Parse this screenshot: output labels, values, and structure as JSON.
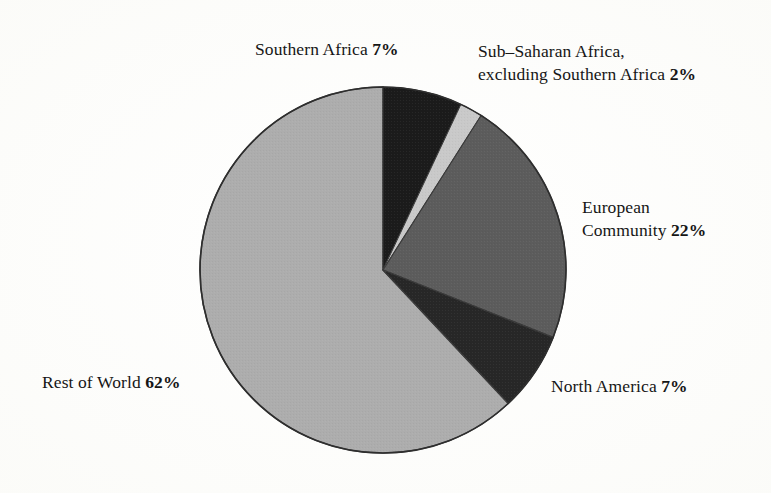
{
  "figure": {
    "background_color": "#fdfdfb",
    "text_color": "#161616"
  },
  "chart_data": {
    "type": "pie",
    "title": "",
    "subtitle": "",
    "xlabel": "",
    "ylabel": "",
    "legend_position": "none",
    "grid": false,
    "value_unit": "percent",
    "total": 100,
    "start_angle_deg": 0,
    "direction": "clockwise",
    "categories": [
      "Southern Africa",
      "Sub–Saharan Africa, excluding Southern Africa",
      "European Community",
      "North America",
      "Rest of World"
    ],
    "values": [
      7,
      2,
      22,
      7,
      62
    ],
    "colors": [
      "#1b1b1b",
      "#c9c9c9",
      "#5c5c5c",
      "#272727",
      "#adadad"
    ],
    "slices": [
      {
        "name": "Southern Africa",
        "value": 7,
        "value_label": "7%",
        "color": "#1b1b1b",
        "start_deg": 0,
        "end_deg": 25.2
      },
      {
        "name": "Sub–Saharan Africa, excluding Southern Africa",
        "value": 2,
        "value_label": "2%",
        "color": "#c9c9c9",
        "start_deg": 25.2,
        "end_deg": 32.4
      },
      {
        "name": "European Community",
        "value": 22,
        "value_label": "22%",
        "color": "#5c5c5c",
        "start_deg": 32.4,
        "end_deg": 111.6
      },
      {
        "name": "North America",
        "value": 7,
        "value_label": "7%",
        "color": "#272727",
        "start_deg": 111.6,
        "end_deg": 136.8
      },
      {
        "name": "Rest of World",
        "value": 62,
        "value_label": "62%",
        "color": "#adadad",
        "start_deg": 136.8,
        "end_deg": 360
      }
    ]
  },
  "labels": {
    "southern_africa": {
      "name": "Southern Africa ",
      "value": "7%"
    },
    "subsaharan_africa": {
      "line1": "Sub–Saharan Africa,",
      "line2_name": "excluding Southern Africa ",
      "value": "2%"
    },
    "european_community": {
      "line1": "European",
      "line2_name": "Community ",
      "value": "22%"
    },
    "north_america": {
      "name": "North America ",
      "value": "7%"
    },
    "rest_of_world": {
      "name": "Rest of World ",
      "value": "62%"
    }
  }
}
